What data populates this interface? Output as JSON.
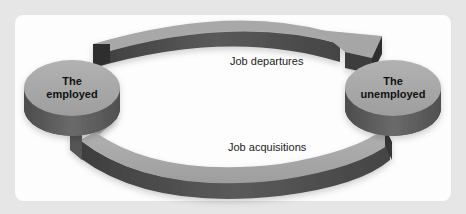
{
  "diagram": {
    "title": "",
    "nodes": [
      {
        "id": "employed",
        "line1": "The",
        "line2": "employed"
      },
      {
        "id": "unemployed",
        "line1": "The",
        "line2": "unemployed"
      }
    ],
    "flows": [
      {
        "id": "departures",
        "label": "Job departures",
        "from": "employed",
        "to": "unemployed"
      },
      {
        "id": "acquisitions",
        "label": "Job acquisitions",
        "from": "unemployed",
        "to": "employed"
      }
    ]
  },
  "colors": {
    "background": "#e6e6e6",
    "card": "#fdfdfd",
    "disk_top": "#a9a9a9",
    "disk_side": "#5e5e5e",
    "arrow_top": "#a4a4a4",
    "arrow_side": "#4a4a4a",
    "text": "#111111"
  }
}
